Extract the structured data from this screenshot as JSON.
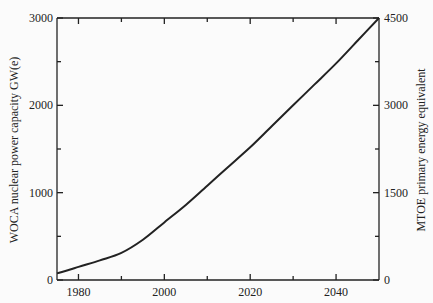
{
  "chart_data": {
    "type": "line",
    "title": "",
    "xlabel": "",
    "ylabel": "WOCA nuclear power capacity GW(e)",
    "y2label": "MTOE primary energy equivalent",
    "xlim": [
      1975,
      2050
    ],
    "ylim": [
      0,
      3000
    ],
    "y2lim": [
      0,
      4500
    ],
    "xticks": [
      1980,
      2000,
      2020,
      2040
    ],
    "xminor": [
      1990,
      2010,
      2030
    ],
    "yticks": [
      0,
      1000,
      2000,
      3000
    ],
    "yminor": [
      500,
      1500,
      2500
    ],
    "y2ticks": [
      0,
      1500,
      3000,
      4500
    ],
    "y2minor": [
      750,
      2250,
      3750
    ],
    "grid": false,
    "legend": null,
    "series": [
      {
        "name": "WOCA nuclear power capacity",
        "color": "#222222",
        "x": [
          1975,
          1980,
          1985,
          1990,
          1995,
          2000,
          2005,
          2010,
          2015,
          2020,
          2025,
          2030,
          2035,
          2040,
          2045,
          2050
        ],
        "values": [
          75,
          150,
          225,
          310,
          460,
          660,
          860,
          1080,
          1300,
          1520,
          1760,
          2000,
          2240,
          2480,
          2740,
          3000
        ]
      }
    ]
  }
}
